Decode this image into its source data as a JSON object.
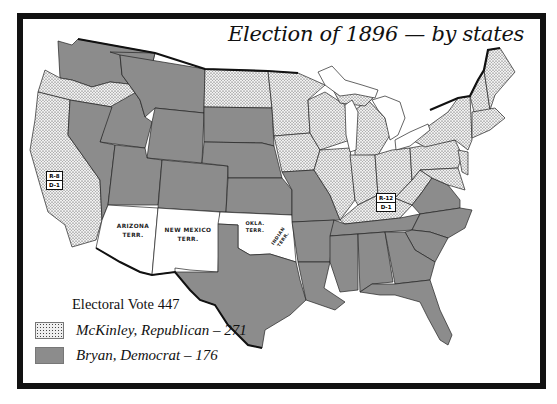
{
  "title": "Election of 1896 — by states",
  "colors": {
    "republican": "#e8e8e8",
    "democrat": "#8c8c8c",
    "territory": "#ffffff",
    "border": "#111111"
  },
  "legend": {
    "heading": "Electoral Vote 447",
    "items": [
      {
        "label": "McKinley, Republican – 271",
        "party": "republican",
        "pattern": "dotted"
      },
      {
        "label": "Bryan, Democrat – 176",
        "party": "democrat",
        "pattern": "solid-gray"
      }
    ]
  },
  "split_states": [
    {
      "state": "California",
      "rep": "R-8",
      "dem": "D-1"
    },
    {
      "state": "Kentucky",
      "rep": "R-12",
      "dem": "D-1"
    }
  ],
  "territories": [
    {
      "name": "arizona",
      "line1": "ARIZONA",
      "line2": "TERR."
    },
    {
      "name": "new-mexico",
      "line1": "NEW MEXICO",
      "line2": "TERR."
    },
    {
      "name": "oklahoma",
      "line1": "OKLA.",
      "line2": "TERR."
    },
    {
      "name": "indian",
      "line1": "INDIAN",
      "line2": "TERR."
    }
  ],
  "republican_states": [
    "Oregon",
    "California",
    "North Dakota",
    "Minnesota",
    "Iowa",
    "Wisconsin",
    "Michigan",
    "Illinois",
    "Indiana",
    "Ohio",
    "West Virginia",
    "Kentucky",
    "Pennsylvania",
    "New York",
    "Maryland",
    "Delaware",
    "New Jersey",
    "Connecticut",
    "Rhode Island",
    "Massachusetts",
    "Vermont",
    "New Hampshire",
    "Maine"
  ],
  "democratic_states": [
    "Washington",
    "Idaho",
    "Montana",
    "Wyoming",
    "Nevada",
    "Utah",
    "Colorado",
    "South Dakota",
    "Nebraska",
    "Kansas",
    "Missouri",
    "Texas",
    "Arkansas",
    "Louisiana",
    "Mississippi",
    "Alabama",
    "Georgia",
    "Florida",
    "Tennessee",
    "North Carolina",
    "South Carolina",
    "Virginia"
  ]
}
